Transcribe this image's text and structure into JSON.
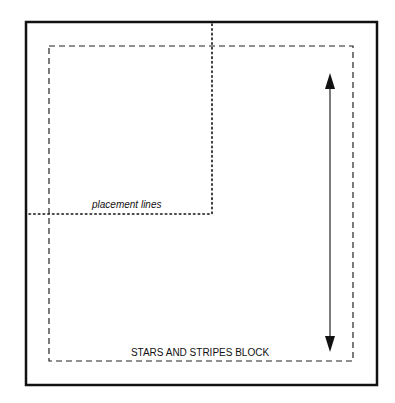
{
  "diagram": {
    "labels": {
      "placement": "placement lines",
      "block": "STARS AND STRIPES BLOCK"
    },
    "elements": [
      {
        "name": "outer-frame",
        "style": "solid"
      },
      {
        "name": "seam-line",
        "style": "dashed"
      },
      {
        "name": "placement-lines",
        "style": "dotted"
      },
      {
        "name": "measure-arrow",
        "style": "double-headed vertical"
      }
    ],
    "colors": {
      "line": "#111111",
      "background": "#ffffff"
    }
  }
}
